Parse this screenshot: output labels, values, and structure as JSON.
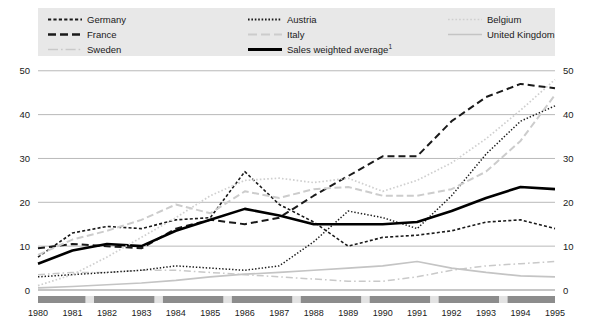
{
  "legend": {
    "items": [
      {
        "label": "Germany",
        "style": "dash-dot-black",
        "color": "#1a1a1a",
        "col": 1,
        "row": 1
      },
      {
        "label": "France",
        "style": "dashed-black",
        "color": "#1a1a1a",
        "col": 1,
        "row": 2
      },
      {
        "label": "Sweden",
        "style": "dash-dot-gray",
        "color": "#c9c9c9",
        "col": 1,
        "row": 3
      },
      {
        "label": "Austria",
        "style": "dotted-black",
        "color": "#1a1a1a",
        "col": 2,
        "row": 1
      },
      {
        "label": "Italy",
        "style": "dashed-gray",
        "color": "#cccccc",
        "col": 2,
        "row": 2
      },
      {
        "label": "Sales weighted average",
        "style": "solid-black-thick",
        "color": "#000000",
        "col": 2,
        "row": 3,
        "superscript": "1"
      },
      {
        "label": "Belgium",
        "style": "dotted-gray",
        "color": "#cfcfcf",
        "col": 3,
        "row": 1
      },
      {
        "label": "United Kingdom",
        "style": "solid-gray",
        "color": "#c4c4c4",
        "col": 3,
        "row": 2
      }
    ],
    "background": "#e8e8e8"
  },
  "chart_data": {
    "type": "line",
    "title": "",
    "xlabel": "",
    "ylabel": "",
    "x": [
      1980,
      1981,
      1982,
      1983,
      1984,
      1985,
      1986,
      1987,
      1988,
      1989,
      1990,
      1991,
      1992,
      1993,
      1994,
      1995
    ],
    "xtick_labels": [
      "1980",
      "1981",
      "1982",
      "1983",
      "1984",
      "1985",
      "1986",
      "1987",
      "1988",
      "1989",
      "1990",
      "1991",
      "1992",
      "1993",
      "1994",
      "1995"
    ],
    "ytick_labels": [
      "0",
      "10",
      "20",
      "30",
      "40",
      "50"
    ],
    "yticks": [
      0,
      10,
      20,
      30,
      40,
      50
    ],
    "ylim": [
      0,
      52
    ],
    "grid": "horizontal",
    "legend_position": "top",
    "dual_y_axis": true,
    "series": [
      {
        "name": "Germany",
        "color": "#1a1a1a",
        "dash": "3,2.2",
        "width": 1.6,
        "values": [
          7.5,
          13.0,
          14.5,
          14.0,
          16.0,
          16.5,
          27.0,
          19.5,
          15.5,
          10.0,
          12.0,
          12.5,
          13.5,
          15.5,
          16.0,
          14.0
        ]
      },
      {
        "name": "France",
        "color": "#1a1a1a",
        "dash": "7,4",
        "width": 2.0,
        "values": [
          9.5,
          10.5,
          10.0,
          9.5,
          14.0,
          16.0,
          15.0,
          16.5,
          21.5,
          26.0,
          30.5,
          30.5,
          38.5,
          44.0,
          47.0,
          46.0
        ]
      },
      {
        "name": "Sweden",
        "color": "#c9c9c9",
        "dash": "7,3,1.6,3",
        "width": 1.5,
        "values": [
          3.5,
          4.0,
          4.0,
          4.5,
          4.5,
          4.0,
          3.5,
          3.0,
          2.5,
          2.0,
          2.0,
          3.0,
          4.5,
          5.5,
          6.0,
          6.5
        ]
      },
      {
        "name": "Austria",
        "color": "#1a1a1a",
        "dash": "1.4,1.9",
        "width": 1.5,
        "values": [
          3.0,
          3.5,
          4.0,
          4.5,
          5.5,
          5.0,
          4.5,
          5.5,
          11.0,
          18.0,
          16.5,
          14.0,
          21.5,
          31.0,
          38.5,
          42.0
        ]
      },
      {
        "name": "Italy",
        "color": "#cccccc",
        "dash": "7,3.5",
        "width": 2.0,
        "values": [
          8.0,
          11.5,
          13.5,
          16.0,
          19.5,
          17.5,
          22.5,
          21.0,
          23.0,
          23.5,
          21.5,
          21.5,
          23.0,
          27.0,
          34.0,
          44.5
        ]
      },
      {
        "name": "Sales weighted average",
        "color": "#000000",
        "dash": "",
        "width": 2.6,
        "values": [
          6.0,
          9.0,
          10.5,
          10.0,
          13.5,
          16.0,
          18.5,
          17.0,
          15.0,
          15.0,
          15.0,
          15.5,
          18.0,
          21.0,
          23.5,
          23.0
        ]
      },
      {
        "name": "Belgium",
        "color": "#cfcfcf",
        "dash": "1.6,2.1",
        "width": 1.7,
        "values": [
          1.0,
          3.5,
          7.5,
          12.0,
          16.5,
          21.5,
          25.0,
          25.5,
          24.5,
          25.5,
          22.5,
          25.0,
          29.0,
          34.5,
          41.0,
          48.0
        ]
      },
      {
        "name": "United Kingdom",
        "color": "#c4c4c4",
        "dash": "",
        "width": 1.7,
        "values": [
          0.5,
          0.8,
          1.2,
          1.6,
          2.2,
          3.0,
          3.6,
          4.0,
          4.5,
          5.0,
          5.5,
          6.5,
          5.0,
          4.0,
          3.2,
          3.0
        ]
      }
    ],
    "xaxis_bands": [
      {
        "start": 1980,
        "end": 1981
      },
      {
        "start": 1982,
        "end": 1983
      },
      {
        "start": 1984,
        "end": 1985
      },
      {
        "start": 1986,
        "end": 1987
      },
      {
        "start": 1988,
        "end": 1989
      },
      {
        "start": 1990,
        "end": 1991
      },
      {
        "start": 1992,
        "end": 1993
      },
      {
        "start": 1994,
        "end": 1995
      }
    ],
    "xaxis_band_color": "#8c8c8c",
    "xaxis_track_color": "#e3e3e3"
  }
}
